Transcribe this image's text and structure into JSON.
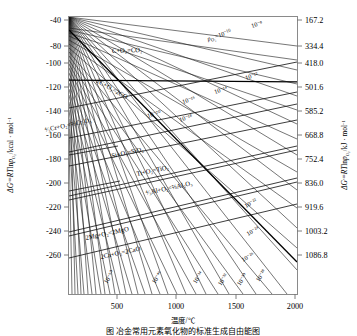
{
  "figure": {
    "caption": "图  冶金常用元素氧化物的标准生成自由能图",
    "type": "ellingham-diagram"
  },
  "axes": {
    "x": {
      "label": "温度/℃",
      "ticks": [
        "500",
        "1000",
        "1500",
        "2000"
      ],
      "tick_values": [
        500,
        1000,
        1500,
        2000
      ],
      "range": [
        250,
        2000
      ]
    },
    "y_left": {
      "label": "ΔG°=RT lnp_O2 /kcal·mol⁻¹",
      "label_parts": {
        "delta": "ΔG",
        "degree": "°",
        "equals": "=",
        "rt": "RT",
        "ln": "ln",
        "p": "p",
        "o2": "O₂",
        "unit": "/kcal · mol",
        "exp": "-1"
      },
      "ticks": [
        "-40",
        "-80",
        "-100",
        "-120",
        "-140",
        "-160",
        "-180",
        "-200",
        "-220",
        "-240",
        "-260"
      ],
      "tick_values": [
        -40,
        -80,
        -100,
        -120,
        -140,
        -160,
        -180,
        -200,
        -220,
        -240,
        -260
      ],
      "range": [
        -275,
        -32
      ]
    },
    "y_right": {
      "label": "ΔG°=RT lnp_O2 /kJ·mol⁻¹",
      "label_parts": {
        "delta": "ΔG",
        "degree": "°",
        "equals": "=",
        "rt": "RT",
        "ln": "ln",
        "p": "p",
        "o2": "O₂",
        "unit": "/kJ · mol",
        "exp": "-1"
      },
      "ticks": [
        "167.2",
        "334.4",
        "418.0",
        "501.6",
        "585.2",
        "668.8",
        "752.4",
        "836.0",
        "919.6",
        "1003.2",
        "1086.8"
      ],
      "tick_values": [
        167.2,
        334.4,
        418.0,
        501.6,
        585.2,
        668.8,
        752.4,
        836.0,
        919.6,
        1003.2,
        1086.8
      ]
    }
  },
  "reactions": [
    {
      "id": "co2",
      "label": "C+O₂=CO₂"
    },
    {
      "id": "co",
      "label": "2C+O₂=2CO"
    },
    {
      "id": "cr2o3",
      "label": "⁴⁄₃Cr+O₂=⅔Cr₂O₃"
    },
    {
      "id": "sio2",
      "label": "Si+O₂=SiO₂"
    },
    {
      "id": "tio2",
      "label": "Ti+O₂=TiO₂"
    },
    {
      "id": "al2o3",
      "label": "⁴⁄₃Al+O₂=⅔Al₂O₃"
    },
    {
      "id": "mgo",
      "label": "2Mg+O₂=2MgO"
    },
    {
      "id": "cao",
      "label": "2Ca+O₂=2CaO"
    }
  ],
  "isobars": {
    "legend_prefix": "p_O2 =",
    "labels": [
      "10⁻⁸",
      "10⁻¹⁰",
      "10⁻¹²",
      "10⁻¹⁴",
      "10⁻¹⁶",
      "10⁻¹⁸",
      "10⁻²⁰",
      "10⁻²²",
      "10⁻²⁴",
      "10⁻²⁶",
      "10⁻²⁸",
      "10⁻³⁰",
      "10⁻³²",
      "10⁻³⁴",
      "10⁻⁴⁶",
      "10⁻⁵⁰"
    ],
    "exponents": [
      -8,
      -10,
      -12,
      -14,
      -16,
      -18,
      -20,
      -22,
      -24,
      -26,
      -28,
      -30,
      -32,
      -34,
      -46,
      -50
    ]
  },
  "colors": {
    "line": "#1a1a1a",
    "frame": "#8a8a8a",
    "text": "#000000",
    "background": "#ffffff"
  }
}
